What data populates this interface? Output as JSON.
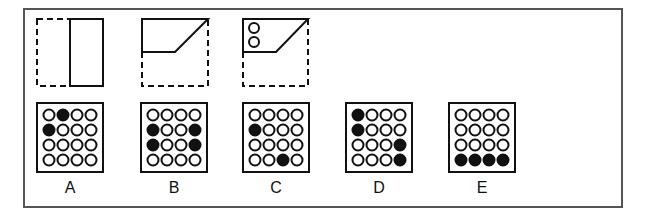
{
  "puzzle": {
    "type": "paper-folding-punch",
    "colors": {
      "stroke": "#111111",
      "frame": "#555555",
      "filled": "#111111",
      "empty": "#ffffff"
    },
    "fold_steps": [
      {
        "step": 1,
        "description": "Left half folded over onto right half (dashed outline shows original square)",
        "square": [
          37,
          19,
          66,
          67
        ],
        "solid": "right-half rectangle"
      },
      {
        "step": 2,
        "description": "Bottom folded up; diagonal fold along top-right",
        "square": [
          142,
          19,
          66,
          67
        ],
        "solid": "trapezoid in upper area"
      },
      {
        "step": 3,
        "description": "Two holes punched in the folded shape",
        "square": [
          243,
          19,
          66,
          67
        ],
        "holes": 2
      }
    ],
    "options": [
      {
        "label": "A",
        "filled": [
          [
            0,
            1
          ],
          [
            1,
            0
          ]
        ]
      },
      {
        "label": "B",
        "filled": [
          [
            1,
            0
          ],
          [
            1,
            3
          ],
          [
            2,
            0
          ],
          [
            2,
            3
          ]
        ]
      },
      {
        "label": "C",
        "filled": [
          [
            1,
            0
          ],
          [
            3,
            2
          ]
        ]
      },
      {
        "label": "D",
        "filled": [
          [
            0,
            0
          ],
          [
            1,
            0
          ],
          [
            2,
            3
          ],
          [
            3,
            3
          ]
        ]
      },
      {
        "label": "E",
        "filled": [
          [
            3,
            0
          ],
          [
            3,
            1
          ],
          [
            3,
            2
          ],
          [
            3,
            3
          ]
        ]
      }
    ],
    "grid": {
      "rows": 4,
      "cols": 4
    }
  }
}
